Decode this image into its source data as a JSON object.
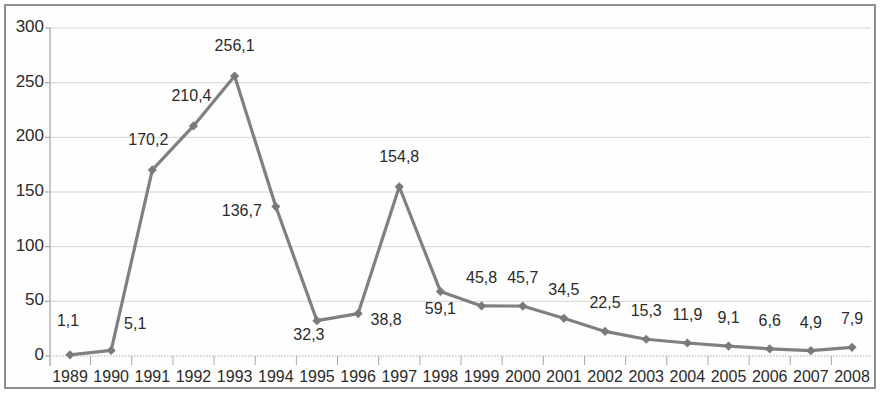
{
  "chart_data": {
    "type": "line",
    "title": "",
    "subtitle": "",
    "xlabel": "",
    "ylabel": "",
    "categories": [
      "1989",
      "1990",
      "1991",
      "1992",
      "1993",
      "1994",
      "1995",
      "1996",
      "1997",
      "1998",
      "1999",
      "2000",
      "2001",
      "2002",
      "2003",
      "2004",
      "2005",
      "2006",
      "2007",
      "2008"
    ],
    "values": [
      1.1,
      5.1,
      170.2,
      210.4,
      256.1,
      136.7,
      32.3,
      38.8,
      154.8,
      59.1,
      45.8,
      45.7,
      34.5,
      22.5,
      15.3,
      11.9,
      9.1,
      6.6,
      4.9,
      7.9
    ],
    "point_labels": [
      "1,1",
      "5,1",
      "170,2",
      "210,4",
      "256,1",
      "136,7",
      "32,3",
      "38,8",
      "154,8",
      "59,1",
      "45,8",
      "45,7",
      "34,5",
      "22,5",
      "15,3",
      "11,9",
      "9,1",
      "6,6",
      "4,9",
      "7,9"
    ],
    "ylim": [
      0,
      300
    ],
    "ytick_values": [
      0,
      50,
      100,
      150,
      200,
      250,
      300
    ],
    "ytick_labels": [
      "0",
      "50",
      "100",
      "150",
      "200",
      "250",
      "300"
    ],
    "grid": true,
    "grid_axis": "y",
    "legend": "none",
    "decimal_separator": ",",
    "series_color": "#808080",
    "marker": "diamond",
    "marker_color": "#7a7a7a",
    "grid_color": "#d4d4d4",
    "axis_color": "#a8a8a8",
    "text_color": "#2b2b2b",
    "frame_color": "#8d8d8d",
    "background_color": "#ffffff"
  },
  "label_offsets": [
    {
      "dx": -2,
      "dy": -34
    },
    {
      "dx": 24,
      "dy": -26
    },
    {
      "dx": -4,
      "dy": -30
    },
    {
      "dx": -2,
      "dy": -30
    },
    {
      "dx": 0,
      "dy": -30
    },
    {
      "dx": -34,
      "dy": 4
    },
    {
      "dx": -8,
      "dy": 14
    },
    {
      "dx": 28,
      "dy": 6
    },
    {
      "dx": 0,
      "dy": -30
    },
    {
      "dx": 0,
      "dy": 18
    },
    {
      "dx": 0,
      "dy": -28
    },
    {
      "dx": 0,
      "dy": -28
    },
    {
      "dx": 0,
      "dy": -28
    },
    {
      "dx": 0,
      "dy": -28
    },
    {
      "dx": 0,
      "dy": -28
    },
    {
      "dx": 0,
      "dy": -28
    },
    {
      "dx": 0,
      "dy": -28
    },
    {
      "dx": 0,
      "dy": -28
    },
    {
      "dx": 0,
      "dy": -28
    },
    {
      "dx": 0,
      "dy": -28
    }
  ]
}
